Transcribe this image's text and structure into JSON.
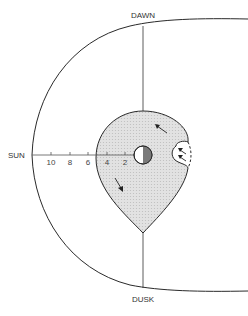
{
  "labels": {
    "top": "DAWN",
    "bottom": "DUSK",
    "left": "SUN"
  },
  "axis": {
    "ticks": [
      "10",
      "8",
      "6",
      "4",
      "2"
    ]
  },
  "colors": {
    "line": "#2a2a2a",
    "fill": "#dcdcdc",
    "earth_dark": "#7a7a7a",
    "earth_light": "#ffffff"
  }
}
